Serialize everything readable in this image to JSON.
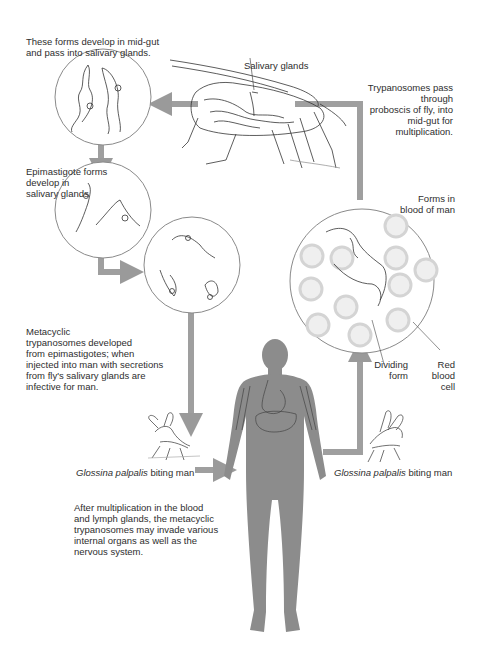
{
  "colors": {
    "arrow": "#9a9a9a",
    "body_silhouette": "#8c8c8c",
    "circle_stroke": "#8a8a8a",
    "line_art": "#333333",
    "text": "#2e2e2e",
    "background": "#ffffff"
  },
  "labels": {
    "midgut_forms": [
      "These forms develop in mid-gut",
      "and pass into salivary glands."
    ],
    "salivary_glands": "Salivary glands",
    "proboscis": [
      "Trypanosomes pass through",
      "proboscis of fly, into",
      "mid-gut for",
      "multiplication."
    ],
    "epimastigote": [
      "Epimastigote forms",
      "develop  in",
      "salivary glands"
    ],
    "forms_blood": [
      "Forms in",
      "blood of man"
    ],
    "metacyclic": [
      "Metacyclic",
      "trypanosomes developed",
      "from epimastigotes; when",
      "injected into man with secretions",
      "from fly's salivary glands are",
      "infective for man."
    ],
    "dividing_form": [
      "Dividing",
      "form"
    ],
    "red_blood_cell": [
      "Red",
      "blood",
      "cell"
    ],
    "biting_left": {
      "species": "Glossina palpalis",
      "rest": " biting man"
    },
    "biting_right": {
      "species": "Glossina palpalis",
      "rest": " biting man"
    },
    "multiplication_note": [
      "After multiplication in the blood",
      "and lymph glands, the metacyclic",
      "trypanosomes may invade various",
      "internal organs as well as the",
      "nervous system."
    ]
  },
  "nodes": [
    {
      "id": "circle-midgut",
      "label": "Mid-gut forms"
    },
    {
      "id": "circle-epimastigote",
      "label": "Epimastigote forms"
    },
    {
      "id": "circle-metacyclic",
      "label": "Metacyclic trypanosomes"
    },
    {
      "id": "circle-blood",
      "label": "Forms in blood of man"
    },
    {
      "id": "tsetse-fly",
      "label": "Tsetse fly"
    },
    {
      "id": "human",
      "label": "Man"
    }
  ]
}
